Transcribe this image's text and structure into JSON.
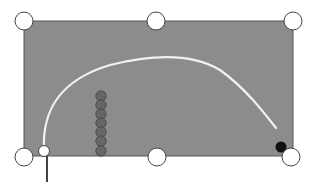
{
  "canvas": {
    "width": 312,
    "height": 189,
    "background": "#ffffff"
  },
  "selection_box": {
    "x": 24,
    "y": 21,
    "width": 269,
    "height": 135,
    "fill": "#8c8c8c",
    "stroke": "#555555"
  },
  "handles": [
    {
      "name": "handle-top-left",
      "cx": 24,
      "cy": 21
    },
    {
      "name": "handle-top-middle",
      "cx": 156,
      "cy": 21
    },
    {
      "name": "handle-top-right",
      "cx": 293,
      "cy": 21
    },
    {
      "name": "handle-bottom-left",
      "cx": 24,
      "cy": 157
    },
    {
      "name": "handle-bottom-middle",
      "cx": 157,
      "cy": 157
    },
    {
      "name": "handle-bottom-right",
      "cx": 291,
      "cy": 157
    }
  ],
  "handle_style": {
    "r": 9,
    "fill": "#ffffff",
    "stroke": "#444444"
  },
  "curve": {
    "d": "M44,150 C42,110 60,80 110,65 C150,55 190,52 220,70 C245,88 262,110 276,128",
    "stroke": "#f2f2f2",
    "width": 2.2
  },
  "curve_start_point": {
    "cx": 44,
    "cy": 151,
    "r": 5.5,
    "fill": "#ffffff",
    "stroke": "#444444"
  },
  "curve_end_point": {
    "cx": 281,
    "cy": 147,
    "r": 5.5,
    "fill": "#111111"
  },
  "anchor_line": {
    "x1": 47,
    "y1": 156,
    "x2": 47,
    "y2": 182,
    "stroke": "#444444",
    "width": 2
  },
  "dot_column": {
    "cx": 101,
    "cy_values": [
      96,
      105,
      114,
      123,
      132,
      141,
      151
    ],
    "r": 5.2,
    "fill": "#666666",
    "stroke": "#444444"
  }
}
